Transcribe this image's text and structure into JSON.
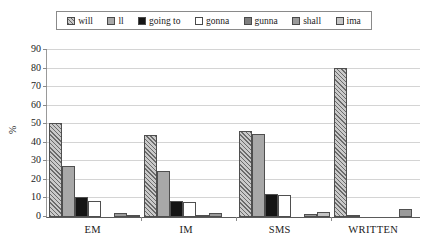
{
  "chart_data": {
    "type": "bar",
    "title": "",
    "xlabel": "",
    "ylabel": "%",
    "ylim": [
      0,
      90
    ],
    "yticks": [
      0,
      10,
      20,
      30,
      40,
      50,
      60,
      70,
      80,
      90
    ],
    "grid": true,
    "legend_position": "top",
    "categories": [
      "EM",
      "IM",
      "SMS",
      "WRITTEN"
    ],
    "series": [
      {
        "name": "will",
        "key": "will",
        "fill": "hatched-gray",
        "color": "#c9c9c9",
        "values": [
          50.5,
          44.2,
          46.2,
          80.5
        ]
      },
      {
        "name": "ll",
        "key": "ll",
        "fill": "solid-gray",
        "color": "#a8a8a8",
        "values": [
          27.5,
          24.8,
          44.5,
          1.0
        ]
      },
      {
        "name": "going to",
        "key": "goingto",
        "fill": "solid-black",
        "color": "#151515",
        "values": [
          11.0,
          8.5,
          12.5,
          0.0
        ]
      },
      {
        "name": "gonna",
        "key": "gonna",
        "fill": "white",
        "color": "#ffffff",
        "values": [
          8.5,
          8.0,
          12.0,
          0.0
        ]
      },
      {
        "name": "gunna",
        "key": "gunna",
        "fill": "dark-gray",
        "color": "#7e7e7e",
        "values": [
          0.0,
          0.6,
          0.0,
          0.0
        ]
      },
      {
        "name": "shall",
        "key": "shall",
        "fill": "mid-gray",
        "color": "#9a9a9a",
        "values": [
          2.0,
          2.2,
          1.8,
          4.2
        ]
      },
      {
        "name": "ima",
        "key": "ima",
        "fill": "light-gray",
        "color": "#c4c4c4",
        "values": [
          0.7,
          0.0,
          2.5,
          0.0
        ]
      }
    ]
  },
  "legend": {
    "items": [
      {
        "label": "will"
      },
      {
        "label": "ll"
      },
      {
        "label": "going to"
      },
      {
        "label": "gonna"
      },
      {
        "label": "gunna"
      },
      {
        "label": "shall"
      },
      {
        "label": "ima"
      }
    ]
  }
}
